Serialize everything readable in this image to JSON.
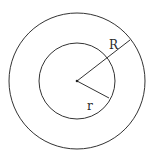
{
  "diagram": {
    "type": "concentric-circles",
    "center": {
      "x": 77,
      "y": 81
    },
    "outer_circle": {
      "radius": 68,
      "label": "R"
    },
    "inner_circle": {
      "radius": 38,
      "label": "r"
    },
    "stroke_color": "#333333",
    "labels": {
      "outer_radius": "R",
      "inner_radius": "r"
    }
  }
}
